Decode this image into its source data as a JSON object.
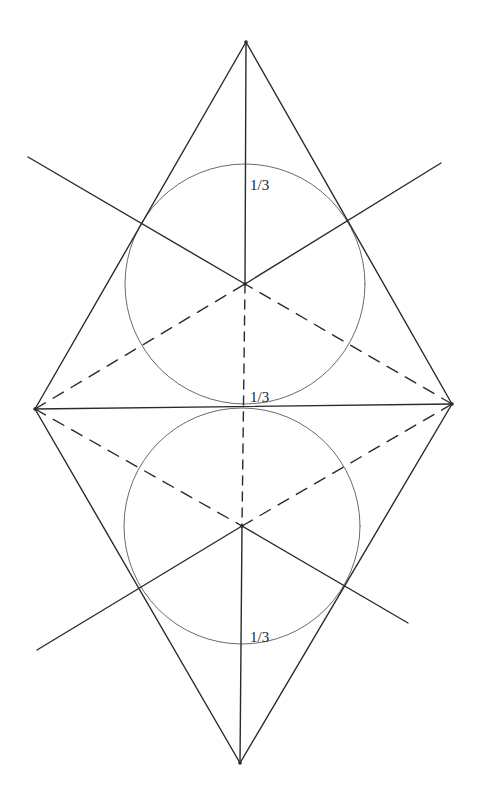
{
  "diagram": {
    "colors": {
      "stroke": "#2a2a2a",
      "circle": "#6a6a6a",
      "background": "#ffffff"
    },
    "vertices": {
      "top": [
        246,
        42
      ],
      "bottom": [
        240,
        763
      ],
      "left": [
        35,
        409
      ],
      "right": [
        452,
        404
      ]
    },
    "centers": {
      "upper": [
        245,
        284
      ],
      "lower": [
        242,
        526
      ]
    },
    "circles": [
      {
        "name": "upper",
        "cx": 245,
        "cy": 284,
        "r": 120
      },
      {
        "name": "lower",
        "cx": 242,
        "cy": 526,
        "r": 118
      }
    ],
    "rays": {
      "upper_left_end": [
        28,
        157
      ],
      "upper_right_end": [
        441,
        163
      ],
      "lower_left_end": [
        37,
        650
      ],
      "lower_right_end": [
        408,
        623
      ]
    },
    "labels": [
      {
        "id": "upper",
        "text": "1/3",
        "x": 250,
        "y": 190
      },
      {
        "id": "middle",
        "text": "1/3",
        "x": 250,
        "y": 402
      },
      {
        "id": "lower",
        "text": "1/3",
        "x": 250,
        "y": 642
      }
    ]
  }
}
